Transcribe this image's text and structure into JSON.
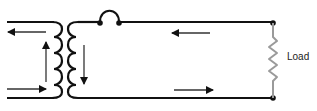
{
  "diagram": {
    "load_label": "Load",
    "colors": {
      "wire": "#111111",
      "arrow": "#333333",
      "resistor": "#9a9a9a"
    },
    "components": [
      "primary-winding",
      "secondary-winding",
      "switch-jumper",
      "load-resistor"
    ],
    "current_arrows": [
      {
        "location": "primary-top",
        "direction": "left"
      },
      {
        "location": "primary-bottom",
        "direction": "right"
      },
      {
        "location": "primary-coil",
        "direction": "up"
      },
      {
        "location": "secondary-coil",
        "direction": "down"
      },
      {
        "location": "secondary-top",
        "direction": "left"
      },
      {
        "location": "secondary-bottom",
        "direction": "right"
      }
    ]
  }
}
